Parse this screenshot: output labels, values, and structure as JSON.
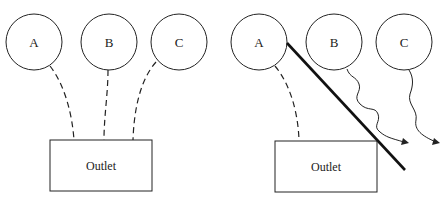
{
  "left_panel": {
    "nodes": [
      {
        "label": "A"
      },
      {
        "label": "B"
      },
      {
        "label": "C"
      }
    ],
    "outlet": {
      "label": "Outlet"
    },
    "connections": [
      "A-Outlet (dashed)",
      "B-Outlet (dashed)",
      "C-Outlet (dashed)"
    ]
  },
  "right_panel": {
    "nodes": [
      {
        "label": "A"
      },
      {
        "label": "B"
      },
      {
        "label": "C"
      }
    ],
    "outlet": {
      "label": "Outlet"
    },
    "connections": [
      "A-Outlet (dashed)",
      "B wavy arrow outward",
      "C wavy arrow outward"
    ],
    "barrier": "thick diagonal line from A to below outlet"
  },
  "colors": {
    "stroke": "#222222",
    "background": "#ffffff"
  }
}
